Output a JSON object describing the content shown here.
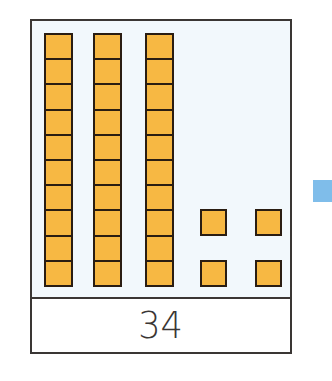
{
  "figure": {
    "type": "base-ten blocks",
    "tens_rods": 3,
    "cubes_per_rod": 10,
    "unit_cubes": 4,
    "number_label": "34"
  },
  "colors": {
    "block_fill": "#f7b843",
    "block_outline": "#2a1d12",
    "frame_border": "#3a3634",
    "blocks_background": "#f2f8fc",
    "side_marker": "#7fbdea"
  }
}
